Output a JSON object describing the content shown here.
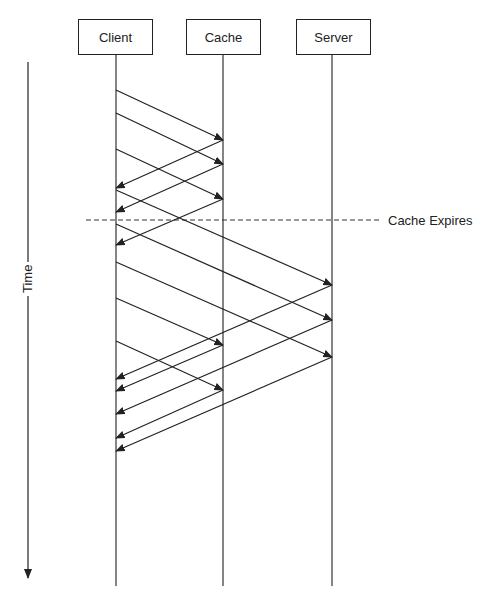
{
  "diagram": {
    "type": "sequence",
    "actors": [
      {
        "id": "client",
        "label": "Client",
        "x": 116
      },
      {
        "id": "cache",
        "label": "Cache",
        "x": 223
      },
      {
        "id": "server",
        "label": "Server",
        "x": 332
      }
    ],
    "time_axis": {
      "label": "Time",
      "direction": "down"
    },
    "event": {
      "label": "Cache Expires",
      "y": 220,
      "style": "dashed"
    },
    "messages": [
      {
        "from": "client",
        "to": "cache",
        "y1": 90,
        "y2": 140
      },
      {
        "from": "client",
        "to": "cache",
        "y1": 113,
        "y2": 164
      },
      {
        "from": "client",
        "to": "cache",
        "y1": 149,
        "y2": 199
      },
      {
        "from": "cache",
        "to": "client",
        "y1": 140,
        "y2": 188
      },
      {
        "from": "cache",
        "to": "client",
        "y1": 164,
        "y2": 212
      },
      {
        "from": "cache",
        "to": "client",
        "y1": 199,
        "y2": 245
      },
      {
        "from": "client",
        "to": "server",
        "y1": 190,
        "y2": 285
      },
      {
        "from": "client",
        "to": "server",
        "y1": 224,
        "y2": 320
      },
      {
        "from": "client",
        "to": "server",
        "y1": 262,
        "y2": 357
      },
      {
        "from": "server",
        "to": "client",
        "y1": 285,
        "y2": 379
      },
      {
        "from": "server",
        "to": "client",
        "y1": 320,
        "y2": 414
      },
      {
        "from": "server",
        "to": "client",
        "y1": 357,
        "y2": 451
      },
      {
        "from": "client",
        "to": "cache",
        "y1": 298,
        "y2": 345
      },
      {
        "from": "client",
        "to": "cache",
        "y1": 341,
        "y2": 390
      },
      {
        "from": "cache",
        "to": "client",
        "y1": 345,
        "y2": 391
      },
      {
        "from": "cache",
        "to": "client",
        "y1": 390,
        "y2": 438
      }
    ]
  }
}
